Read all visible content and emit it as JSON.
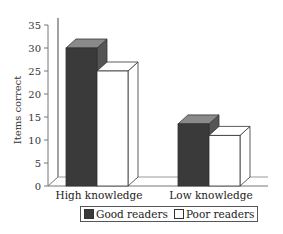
{
  "chart_data": {
    "type": "bar",
    "style": "3d-clustered",
    "title": "",
    "xlabel": "",
    "ylabel": "Items correct",
    "ylim": [
      0,
      35
    ],
    "yticks": [
      0,
      5,
      10,
      15,
      20,
      25,
      30,
      35
    ],
    "grid": false,
    "legend_position": "bottom",
    "categories": [
      "High knowledge",
      "Low knowledge"
    ],
    "series": [
      {
        "name": "Good readers",
        "values": [
          30,
          13.5
        ],
        "color": "#3a3a3a"
      },
      {
        "name": "Poor readers",
        "values": [
          25,
          11
        ],
        "color": "#ffffff"
      }
    ]
  },
  "legend": {
    "items": [
      {
        "label": "Good readers",
        "color": "#3a3a3a"
      },
      {
        "label": "Poor readers",
        "color": "#ffffff"
      }
    ]
  }
}
